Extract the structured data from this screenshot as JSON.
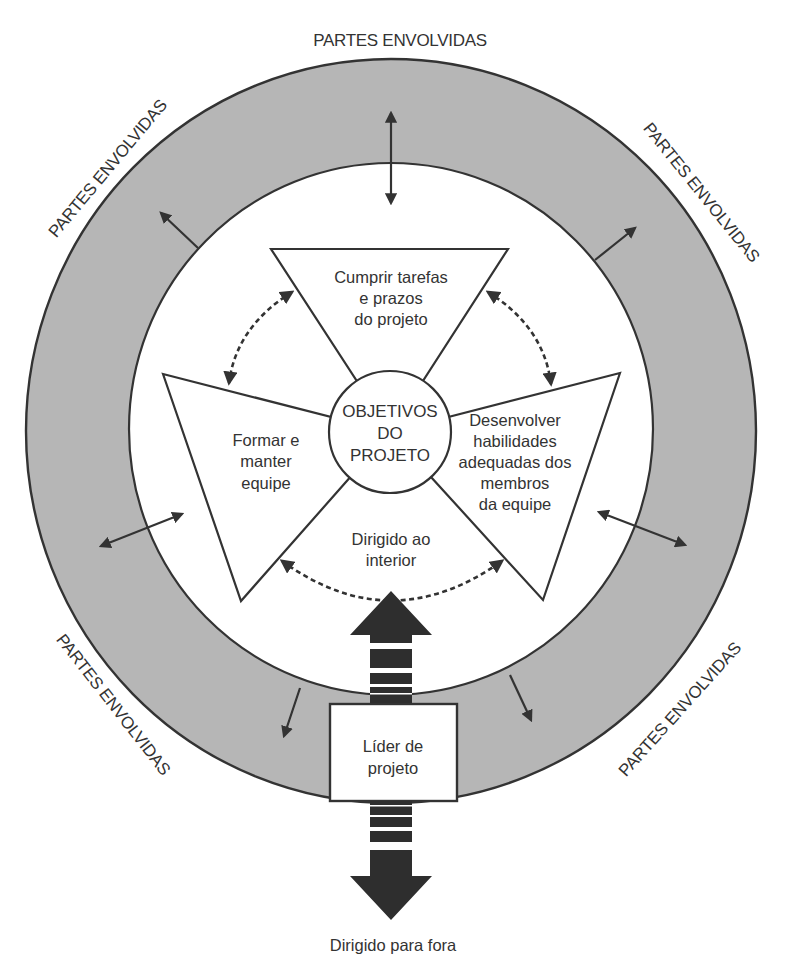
{
  "diagram": {
    "colors": {
      "ring_fill": "#b6b6b6",
      "stroke": "#333333",
      "big_arrow": "#2e2e2e",
      "background": "#ffffff"
    },
    "ring_labels": {
      "top": "PARTES ENVOLVIDAS",
      "upper_left": "PARTES ENVOLVIDAS",
      "upper_right": "PARTES ENVOLVIDAS",
      "lower_left": "PARTES ENVOLVIDAS",
      "lower_right": "PARTES ENVOLVIDAS"
    },
    "center": {
      "lines": [
        "OBJETIVOS",
        "DO",
        "PROJETO"
      ]
    },
    "nodes": {
      "top": {
        "lines": [
          "Cumprir tarefas",
          "e prazos",
          "do projeto"
        ]
      },
      "left": {
        "lines": [
          "Formar e",
          "manter",
          "equipe"
        ]
      },
      "right": {
        "lines": [
          "Desenvolver",
          "habilidades",
          "adequadas dos",
          "membros",
          "da equipe"
        ]
      }
    },
    "inward_label": {
      "lines": [
        "Dirigido ao",
        "interior"
      ]
    },
    "leader_box": {
      "lines": [
        "Líder de",
        "projeto"
      ]
    },
    "outward_label": "Dirigido para fora"
  }
}
